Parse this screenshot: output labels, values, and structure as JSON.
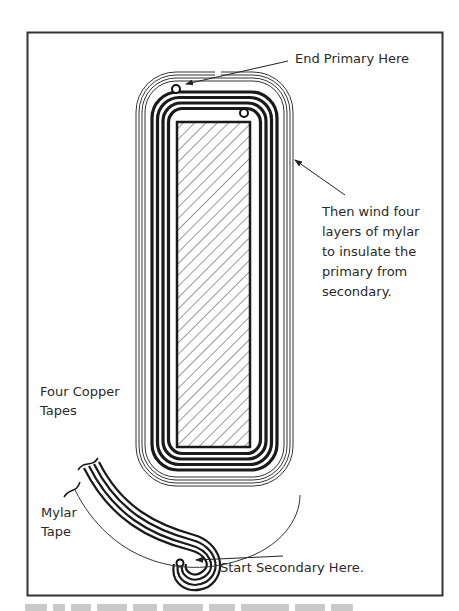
{
  "figure": {
    "labels": {
      "end_primary": "End Primary Here",
      "then_wind": [
        "Then wind four",
        "layers of mylar",
        "to insulate the",
        "primary from",
        "secondary."
      ],
      "four_copper": [
        "Four Copper",
        "Tapes"
      ],
      "mylar_tape": [
        "Mylar",
        "Tape"
      ],
      "start_secondary": "Start Secondary Here."
    },
    "components": {
      "core": "hatched rectangular core",
      "primary_winding": "four copper tape layers (thick dark bands)",
      "insulation": "four layers of mylar (thin lines)",
      "secondary_start": "spiral of copper tapes with mylar tape"
    },
    "colors": {
      "ink": "#1a1a1a",
      "frame": "#333333",
      "background": "#ffffff"
    }
  }
}
